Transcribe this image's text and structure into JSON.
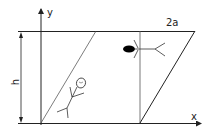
{
  "diagram": {
    "type": "geometry-figure",
    "labels": {
      "y_axis": "y",
      "x_axis": "x",
      "height": "h",
      "width": "2a"
    },
    "colors": {
      "stroke": "#222222",
      "background": "#ffffff",
      "fill": "#000000"
    },
    "elements": [
      "coordinate axes x and y",
      "parallelogram of height h and top width 2a",
      "vertical line through parallelogram",
      "stick figure leaning on left diagonal",
      "stick figure lying horizontally with filled head near top right"
    ]
  }
}
